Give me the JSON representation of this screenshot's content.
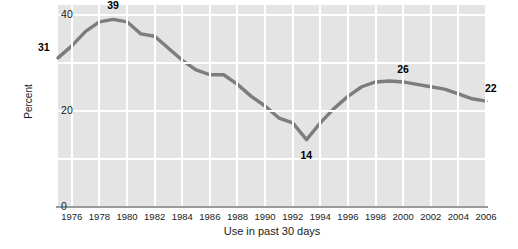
{
  "chart_data": {
    "type": "line",
    "title": "",
    "xlabel": "Use in past 30 days",
    "ylabel": "Percent",
    "xlim": [
      1975,
      2006
    ],
    "ylim": [
      0,
      42
    ],
    "yticks": [
      0,
      20,
      40
    ],
    "ytick_labels": [
      "0",
      "20",
      "40"
    ],
    "xticks": [
      1976,
      1978,
      1980,
      1982,
      1984,
      1986,
      1988,
      1990,
      1992,
      1994,
      1996,
      1998,
      2000,
      2002,
      2004,
      2006
    ],
    "xtick_labels": [
      "1976",
      "1978",
      "1980",
      "1982",
      "1984",
      "1986",
      "1988",
      "1990",
      "1992",
      "1994",
      "1996",
      "1998",
      "2000",
      "2002",
      "2004",
      "2006"
    ],
    "grid": true,
    "legend": "none",
    "line_color": "#7d7d7d",
    "plot_bg_color": "#e4e4e4",
    "gridline_color": "#ffffff",
    "x": [
      1975,
      1976,
      1977,
      1978,
      1979,
      1980,
      1981,
      1982,
      1983,
      1984,
      1985,
      1986,
      1987,
      1988,
      1989,
      1990,
      1991,
      1992,
      1993,
      1994,
      1995,
      1996,
      1997,
      1998,
      1999,
      2000,
      2001,
      2002,
      2003,
      2004,
      2005,
      2006
    ],
    "values": [
      31,
      33.5,
      36.5,
      38.5,
      39,
      38.5,
      36,
      35.5,
      33,
      30.5,
      28.5,
      27.5,
      27.5,
      25.5,
      23,
      21,
      18.5,
      17.5,
      14,
      17.5,
      20.5,
      23,
      25,
      26,
      26.2,
      26,
      25.5,
      25,
      24.5,
      23.5,
      22.5,
      22
    ],
    "annotations": [
      {
        "label": "31",
        "x": 1975,
        "y": 31
      },
      {
        "label": "39",
        "x": 1979,
        "y": 39
      },
      {
        "label": "14",
        "x": 1993,
        "y": 14
      },
      {
        "label": "26",
        "x": 2000,
        "y": 26
      },
      {
        "label": "22",
        "x": 2006,
        "y": 22
      }
    ]
  },
  "axis": {
    "y_title": "Percent",
    "x_title": "Use in past 30 days"
  }
}
